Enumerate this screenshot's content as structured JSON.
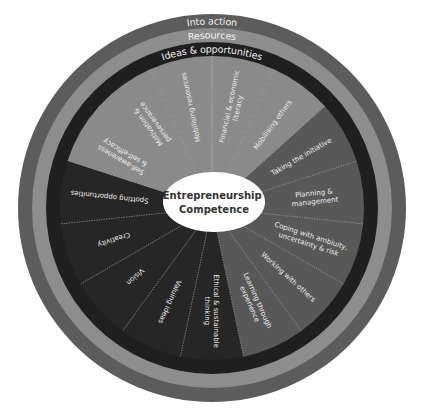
{
  "diagram": {
    "title": "Entrepreneurship Competence",
    "center": {
      "lines": [
        "Entrepreneurship",
        "Competence"
      ],
      "fill": "#ffffff",
      "text_color": "#333333"
    },
    "rings": [
      {
        "label": "Into action",
        "color": "#5c5c5c"
      },
      {
        "label": "Resources",
        "color": "#8d8d8d"
      },
      {
        "label": "Ideas & opportunities",
        "color": "#1f1f1f"
      }
    ],
    "areas": [
      {
        "name": "Resources",
        "color": "#8a8a8a",
        "competences": [
          {
            "lines": [
              "Self-awareness",
              "& self-efficacy"
            ]
          },
          {
            "lines": [
              "Motivation &",
              "perseverance"
            ]
          },
          {
            "lines": [
              "Mobilising resources"
            ]
          },
          {
            "lines": [
              "Financial & economic",
              "literacy"
            ]
          },
          {
            "lines": [
              "Mobilising others"
            ]
          }
        ]
      },
      {
        "name": "Into action",
        "color": "#585858",
        "competences": [
          {
            "lines": [
              "Taking the initiative"
            ]
          },
          {
            "lines": [
              "Planning &",
              "management"
            ]
          },
          {
            "lines": [
              "Coping with ambiuity,",
              "uncertainty & risk"
            ]
          },
          {
            "lines": [
              "Working with others"
            ]
          },
          {
            "lines": [
              "Learning through",
              "experience"
            ]
          }
        ]
      },
      {
        "name": "Ideas & opportunities",
        "color": "#262626",
        "competences": [
          {
            "lines": [
              "Ethical & sustainable",
              "thinking"
            ]
          },
          {
            "lines": [
              "Valuing ideas"
            ]
          },
          {
            "lines": [
              "Vision"
            ]
          },
          {
            "lines": [
              "Creativity"
            ]
          },
          {
            "lines": [
              "Spotting opportunities"
            ]
          }
        ]
      }
    ]
  }
}
